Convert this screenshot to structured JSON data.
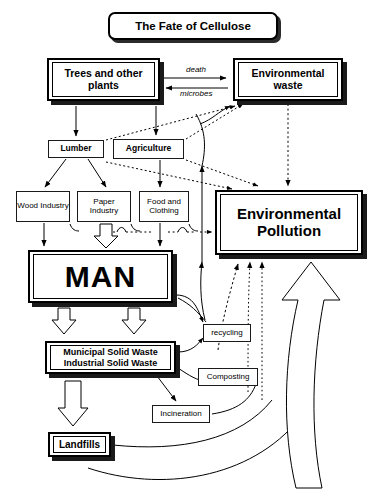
{
  "title": {
    "text": "The Fate of Cellulose"
  },
  "nodes": {
    "trees": "Trees and other plants",
    "environmental_waste": "Environmental waste",
    "lumber": "Lumber",
    "agriculture": "Agriculture",
    "wood_industry": "Wood Industry",
    "paper_industry": "Paper Industry",
    "food_clothing": "Food and Clothing",
    "environmental_pollution": "Environmental Pollution",
    "man": "MAN",
    "municipal_solid_waste": "Municipal Solid Waste",
    "industrial_solid_waste": "Industrial Solid Waste",
    "landfills": "Landfills",
    "recycling": "recycling",
    "composting": "Composting",
    "incineration": "Incineration"
  },
  "edge_labels": {
    "death": "death",
    "microbes": "microbes"
  },
  "colors": {
    "ink": "#000000",
    "paper": "#ffffff",
    "shadow": "#1a1a1a"
  }
}
